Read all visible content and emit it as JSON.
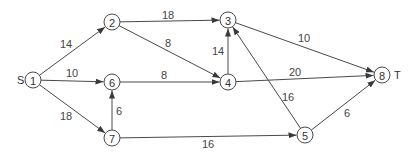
{
  "diagram": {
    "type": "directed-network",
    "source_label": "S",
    "sink_label": "T",
    "nodes": [
      {
        "id": "1",
        "label": "1",
        "x": 33,
        "y": 80
      },
      {
        "id": "2",
        "label": "2",
        "x": 112,
        "y": 22
      },
      {
        "id": "3",
        "label": "3",
        "x": 228,
        "y": 20
      },
      {
        "id": "4",
        "label": "4",
        "x": 228,
        "y": 82
      },
      {
        "id": "5",
        "label": "5",
        "x": 305,
        "y": 135
      },
      {
        "id": "6",
        "label": "6",
        "x": 112,
        "y": 82
      },
      {
        "id": "7",
        "label": "7",
        "x": 112,
        "y": 138
      },
      {
        "id": "8",
        "label": "8",
        "x": 382,
        "y": 75
      }
    ],
    "edges": [
      {
        "from": "1",
        "to": "2",
        "weight": "14",
        "lx": 66,
        "ly": 44
      },
      {
        "from": "1",
        "to": "6",
        "weight": "10",
        "lx": 72,
        "ly": 73
      },
      {
        "from": "1",
        "to": "7",
        "weight": "18",
        "lx": 66,
        "ly": 116
      },
      {
        "from": "2",
        "to": "3",
        "weight": "18",
        "lx": 168,
        "ly": 15
      },
      {
        "from": "2",
        "to": "4",
        "weight": "8",
        "lx": 168,
        "ly": 43
      },
      {
        "from": "6",
        "to": "4",
        "weight": "8",
        "lx": 164,
        "ly": 75
      },
      {
        "from": "7",
        "to": "6",
        "weight": "6",
        "lx": 119,
        "ly": 111
      },
      {
        "from": "4",
        "to": "3",
        "weight": "14",
        "lx": 218,
        "ly": 51
      },
      {
        "from": "3",
        "to": "8",
        "weight": "10",
        "lx": 304,
        "ly": 38
      },
      {
        "from": "4",
        "to": "8",
        "weight": "20",
        "lx": 295,
        "ly": 72
      },
      {
        "from": "5",
        "to": "3",
        "weight": "16",
        "lx": 288,
        "ly": 97
      },
      {
        "from": "7",
        "to": "5",
        "weight": "16",
        "lx": 208,
        "ly": 144
      },
      {
        "from": "5",
        "to": "8",
        "weight": "6",
        "lx": 347,
        "ly": 113
      }
    ]
  },
  "colors": {
    "line": "#4a4a4a",
    "text": "#333333",
    "background": "#ffffff"
  }
}
